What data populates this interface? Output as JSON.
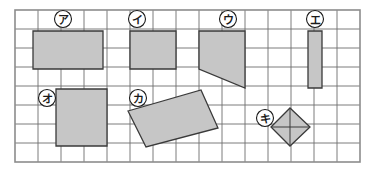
{
  "figure": {
    "background_color": "#ffffff",
    "border_color": "#8c8c8c",
    "grid_line_color": "#6e6e6e",
    "shape_fill_color": "#c6c6c6",
    "shape_stroke_color": "#3a3a3a",
    "label_circle_fill": "#ffffff",
    "label_circle_stroke": "#1a1a1a",
    "label_text_color": "#1a1a1a",
    "grid": {
      "origin_x": 15,
      "origin_y": 10,
      "cell_width": 23,
      "cell_height": 19,
      "columns": 15,
      "rows": 8
    },
    "shapes": [
      {
        "id": "shape-a",
        "label": "ア",
        "kind": "rectangle",
        "points": "33,31 103,31 103,69 33,69",
        "label_circle": {
          "cx": 63,
          "cy": 19,
          "r": 8.5
        }
      },
      {
        "id": "shape-i",
        "label": "イ",
        "kind": "square",
        "points": "130,31 176,31 176,69 130,69",
        "label_circle": {
          "cx": 137,
          "cy": 19,
          "r": 8.5
        }
      },
      {
        "id": "shape-u",
        "label": "ウ",
        "kind": "trapezoid",
        "points": "199,31 245,31 245,88 199,69",
        "label_circle": {
          "cx": 228,
          "cy": 19,
          "r": 8.5
        }
      },
      {
        "id": "shape-e",
        "label": "エ",
        "kind": "rectangle",
        "points": "308,31 322,31 322,88 308,88",
        "label_circle": {
          "cx": 315,
          "cy": 19,
          "r": 8.5
        }
      },
      {
        "id": "shape-o",
        "label": "オ",
        "kind": "square",
        "points": "56,89 107,89 107,146 56,146",
        "label_circle": {
          "cx": 47,
          "cy": 98,
          "r": 8.5
        }
      },
      {
        "id": "shape-ka",
        "label": "カ",
        "kind": "rotated-rectangle",
        "points": "128,111 201,90 218,128 146,147",
        "label_circle": {
          "cx": 138,
          "cy": 98,
          "r": 8.5
        }
      },
      {
        "id": "shape-ki",
        "label": "キ",
        "kind": "diamond",
        "points": "290,108 310,127 290,146 271,127",
        "label_circle": {
          "cx": 265,
          "cy": 118,
          "r": 8.5
        }
      }
    ],
    "diagonals": [
      {
        "id": "diagonal-ki-vertical",
        "x1": 290,
        "y1": 108,
        "x2": 290,
        "y2": 146
      },
      {
        "id": "diagonal-ki-horizontal",
        "x1": 271,
        "y1": 127,
        "x2": 310,
        "y2": 127
      }
    ]
  }
}
